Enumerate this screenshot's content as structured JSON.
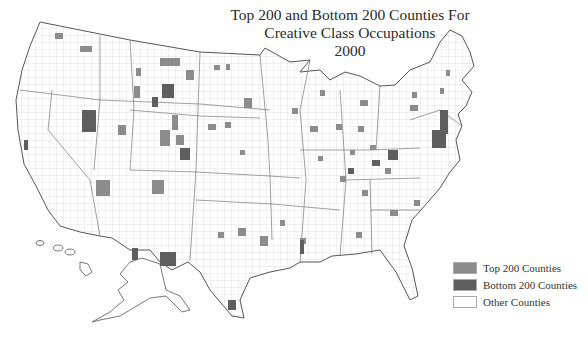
{
  "title": {
    "line1": "Top 200 and Bottom 200 Counties For",
    "line2": "Creative Class Occupations",
    "line3": "2000"
  },
  "legend": {
    "items": [
      {
        "label": "Top 200 Counties",
        "color": "#8c8c8c"
      },
      {
        "label": "Bottom 200 Counties",
        "color": "#5e5e5e"
      },
      {
        "label": "Other Counties",
        "color": "#ffffff"
      }
    ]
  },
  "map": {
    "region": "United States (counties)",
    "outline_color": "#555555",
    "county_line_color": "#c8c8c8"
  }
}
